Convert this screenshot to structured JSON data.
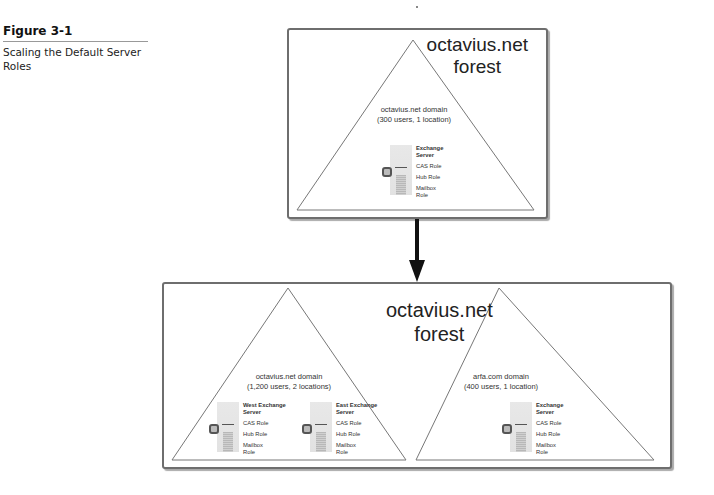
{
  "caption": {
    "figure_number": "Figure 3-1",
    "title": "Scaling the Default Server Roles"
  },
  "before": {
    "forest_label_line1": "octavius.net",
    "forest_label_line2": "forest",
    "domains": [
      {
        "name": "octavius.net domain",
        "detail": "(300 users, 1 location)",
        "servers": [
          {
            "name_line1": "Exchange",
            "name_line2": "Server",
            "roles": [
              "CAS Role",
              "Hub Role"
            ],
            "mailbox_line1": "Mailbox",
            "mailbox_line2": "Role"
          }
        ]
      }
    ]
  },
  "after": {
    "forest_label_line1": "octavius.net",
    "forest_label_line2": "forest",
    "domains": [
      {
        "name": "octavius.net domain",
        "detail": "(1,200 users, 2 locations)",
        "servers": [
          {
            "name_line1": "West Exchange",
            "name_line2": "Server",
            "roles": [
              "CAS Role",
              "Hub Role"
            ],
            "mailbox_line1": "Mailbox",
            "mailbox_line2": "Role"
          },
          {
            "name_line1": "East Exchange",
            "name_line2": "Server",
            "roles": [
              "CAS Role",
              "Hub Role"
            ],
            "mailbox_line1": "Mailbox",
            "mailbox_line2": "Role"
          }
        ]
      },
      {
        "name": "arfa.com domain",
        "detail": "(400 users, 1 location)",
        "servers": [
          {
            "name_line1": "Exchange",
            "name_line2": "Server",
            "roles": [
              "CAS Role",
              "Hub Role"
            ],
            "mailbox_line1": "Mailbox",
            "mailbox_line2": "Role"
          }
        ]
      }
    ]
  },
  "colors": {
    "box_border": "#6e6e6e",
    "arrow": "#111111",
    "triangle_line": "#777777"
  }
}
